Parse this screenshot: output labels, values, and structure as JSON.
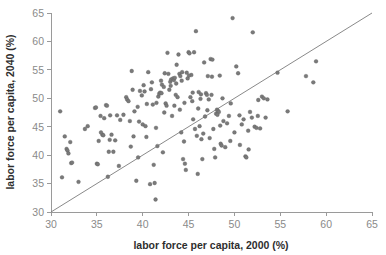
{
  "chart_data": {
    "type": "scatter",
    "title": "",
    "xlabel": "labor force per capita, 2000 (%)",
    "ylabel": "labor force per capita, 2040 (%)",
    "xlim": [
      30,
      65
    ],
    "ylim": [
      30,
      65
    ],
    "xticks": [
      30,
      35,
      40,
      45,
      50,
      55,
      60,
      65
    ],
    "yticks": [
      30,
      35,
      40,
      45,
      50,
      55,
      60,
      65
    ],
    "grid": false,
    "legend": null,
    "annotations": [
      {
        "kind": "reference-line",
        "description": "45-degree identity line y = x",
        "from": [
          30,
          30
        ],
        "to": [
          65,
          65
        ]
      }
    ],
    "marker": {
      "shape": "circle",
      "color": "#7a7a7a",
      "edge_color": "#5e5e5e",
      "size_px": 3.0
    },
    "point_count": 188,
    "points": [
      [
        31.0,
        47.7
      ],
      [
        31.2,
        36.1
      ],
      [
        31.5,
        43.3
      ],
      [
        31.7,
        41.1
      ],
      [
        31.8,
        40.8
      ],
      [
        31.9,
        40.3
      ],
      [
        32.1,
        42.3
      ],
      [
        32.2,
        38.6
      ],
      [
        32.3,
        38.7
      ],
      [
        33.0,
        35.3
      ],
      [
        33.7,
        44.6
      ],
      [
        34.0,
        45.1
      ],
      [
        34.8,
        48.3
      ],
      [
        34.9,
        48.4
      ],
      [
        35.0,
        38.5
      ],
      [
        35.1,
        38.4
      ],
      [
        35.2,
        42.5
      ],
      [
        35.4,
        46.9
      ],
      [
        35.6,
        43.6
      ],
      [
        35.7,
        43.5
      ],
      [
        35.8,
        46.5
      ],
      [
        36.0,
        48.8
      ],
      [
        36.1,
        48.7
      ],
      [
        36.2,
        36.2
      ],
      [
        36.3,
        40.6
      ],
      [
        36.4,
        42.7
      ],
      [
        36.8,
        40.6
      ],
      [
        37.0,
        42.6
      ],
      [
        37.2,
        47.0
      ],
      [
        37.4,
        38.1
      ],
      [
        38.2,
        50.2
      ],
      [
        38.3,
        49.8
      ],
      [
        38.6,
        46.0
      ],
      [
        38.7,
        41.5
      ],
      [
        38.8,
        54.8
      ],
      [
        38.9,
        51.5
      ],
      [
        39.0,
        43.3
      ],
      [
        39.1,
        47.7
      ],
      [
        39.3,
        35.5
      ],
      [
        39.5,
        39.6
      ],
      [
        39.7,
        51.3
      ],
      [
        39.9,
        50.5
      ],
      [
        40.0,
        45.4
      ],
      [
        40.1,
        52.3
      ],
      [
        40.2,
        51.2
      ],
      [
        40.3,
        45.1
      ],
      [
        40.4,
        43.2
      ],
      [
        40.6,
        54.6
      ],
      [
        40.8,
        34.9
      ],
      [
        41.0,
        52.8
      ],
      [
        41.1,
        48.9
      ],
      [
        41.2,
        38.3
      ],
      [
        41.3,
        35.1
      ],
      [
        41.4,
        32.2
      ],
      [
        41.5,
        49.2
      ],
      [
        41.6,
        41.6
      ],
      [
        41.7,
        50.3
      ],
      [
        41.8,
        50.8
      ],
      [
        41.9,
        51.0
      ],
      [
        42.0,
        53.1
      ],
      [
        42.1,
        52.4
      ],
      [
        42.2,
        40.5
      ],
      [
        42.3,
        52.0
      ],
      [
        42.4,
        54.4
      ],
      [
        42.5,
        49.1
      ],
      [
        42.6,
        48.7
      ],
      [
        42.7,
        58.0
      ],
      [
        42.8,
        54.3
      ],
      [
        42.9,
        51.5
      ],
      [
        43.0,
        52.9
      ],
      [
        43.1,
        53.3
      ],
      [
        43.2,
        46.9
      ],
      [
        43.3,
        53.5
      ],
      [
        43.4,
        53.2
      ],
      [
        43.5,
        53.6
      ],
      [
        43.6,
        50.6
      ],
      [
        43.7,
        55.9
      ],
      [
        43.8,
        50.2
      ],
      [
        43.9,
        57.7
      ],
      [
        44.0,
        54.3
      ],
      [
        44.1,
        53.9
      ],
      [
        44.2,
        44.0
      ],
      [
        44.3,
        54.6
      ],
      [
        44.4,
        39.3
      ],
      [
        44.5,
        42.4
      ],
      [
        44.6,
        38.5
      ],
      [
        44.7,
        37.4
      ],
      [
        44.8,
        54.5
      ],
      [
        44.9,
        53.5
      ],
      [
        45.0,
        58.1
      ],
      [
        45.1,
        57.9
      ],
      [
        45.2,
        50.2
      ],
      [
        45.3,
        54.1
      ],
      [
        45.4,
        49.5
      ],
      [
        45.5,
        46.3
      ],
      [
        45.6,
        58.1
      ],
      [
        45.7,
        44.6
      ],
      [
        45.8,
        61.8
      ],
      [
        45.9,
        43.4
      ],
      [
        46.0,
        36.7
      ],
      [
        46.1,
        51.1
      ],
      [
        46.2,
        45.1
      ],
      [
        46.3,
        49.9
      ],
      [
        46.4,
        42.8
      ],
      [
        46.5,
        39.3
      ],
      [
        46.6,
        43.8
      ],
      [
        46.7,
        56.3
      ],
      [
        46.8,
        46.8
      ],
      [
        46.9,
        50.9
      ],
      [
        47.0,
        50.6
      ],
      [
        47.1,
        53.9
      ],
      [
        47.2,
        49.8
      ],
      [
        47.3,
        43.0
      ],
      [
        47.4,
        56.9
      ],
      [
        47.5,
        50.6
      ],
      [
        47.6,
        56.8
      ],
      [
        47.7,
        44.6
      ],
      [
        47.8,
        41.1
      ],
      [
        47.9,
        39.6
      ],
      [
        48.0,
        47.3
      ],
      [
        48.1,
        48.0
      ],
      [
        48.2,
        47.8
      ],
      [
        48.3,
        47.6
      ],
      [
        48.4,
        54.0
      ],
      [
        48.5,
        42.0
      ],
      [
        48.6,
        41.7
      ],
      [
        48.7,
        50.0
      ],
      [
        48.8,
        46.0
      ],
      [
        49.0,
        41.4
      ],
      [
        49.2,
        45.6
      ],
      [
        49.4,
        46.9
      ],
      [
        49.6,
        49.1
      ],
      [
        49.8,
        64.1
      ],
      [
        50.0,
        44.0
      ],
      [
        50.2,
        55.6
      ],
      [
        50.4,
        54.4
      ],
      [
        50.6,
        41.8
      ],
      [
        50.8,
        45.4
      ],
      [
        51.0,
        46.3
      ],
      [
        51.2,
        39.8
      ],
      [
        51.3,
        39.6
      ],
      [
        51.5,
        44.3
      ],
      [
        51.7,
        47.6
      ],
      [
        51.9,
        46.6
      ],
      [
        52.0,
        61.6
      ],
      [
        52.2,
        45.0
      ],
      [
        52.4,
        44.8
      ],
      [
        52.6,
        49.7
      ],
      [
        52.8,
        44.7
      ],
      [
        53.0,
        50.3
      ],
      [
        53.2,
        50.0
      ],
      [
        53.4,
        46.6
      ],
      [
        53.6,
        49.8
      ],
      [
        54.7,
        54.5
      ],
      [
        55.8,
        47.7
      ],
      [
        57.8,
        53.9
      ],
      [
        58.6,
        52.8
      ],
      [
        58.9,
        56.5
      ],
      [
        36.6,
        43.6
      ],
      [
        37.9,
        47.1
      ],
      [
        39.6,
        45.9
      ],
      [
        40.9,
        51.6
      ],
      [
        42.05,
        50.9
      ],
      [
        43.05,
        52.2
      ],
      [
        43.65,
        52.6
      ],
      [
        44.25,
        53.1
      ],
      [
        45.05,
        54.0
      ],
      [
        45.45,
        51.0
      ],
      [
        46.35,
        50.7
      ],
      [
        47.05,
        47.9
      ],
      [
        47.55,
        53.8
      ],
      [
        48.15,
        47.1
      ],
      [
        44.05,
        48.0
      ],
      [
        42.35,
        47.5
      ],
      [
        41.45,
        44.8
      ],
      [
        40.45,
        49.0
      ],
      [
        39.45,
        48.5
      ],
      [
        38.45,
        49.5
      ],
      [
        37.55,
        46.2
      ],
      [
        36.45,
        47.0
      ],
      [
        35.45,
        44.0
      ],
      [
        43.45,
        48.7
      ],
      [
        44.55,
        49.2
      ],
      [
        46.05,
        48.2
      ],
      [
        48.45,
        45.2
      ],
      [
        49.55,
        42.5
      ],
      [
        50.55,
        47.0
      ],
      [
        51.55,
        41.0
      ],
      [
        52.55,
        46.9
      ]
    ]
  }
}
